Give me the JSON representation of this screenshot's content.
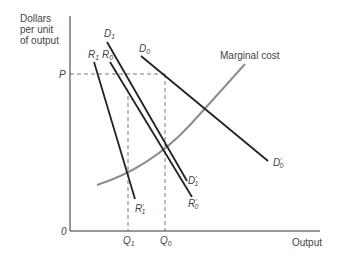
{
  "axes": {
    "y_label_lines": [
      "Dollars",
      "per unit",
      "of output"
    ],
    "x_label": "Output",
    "origin": "0",
    "price_label": "P",
    "q1_label": "Q",
    "q1_sub": "1",
    "q0_label": "Q",
    "q0_sub": "0"
  },
  "curves": {
    "mc_label": "Marginal cost",
    "d1": {
      "name": "D",
      "sub": "1",
      "end_name": "D",
      "end_sup": "′",
      "end_sub": "1"
    },
    "d0": {
      "name": "D",
      "sub": "0",
      "end_name": "D",
      "end_sup": "′",
      "end_sub": "0"
    },
    "r1": {
      "name": "R",
      "sub": "1",
      "end_name": "R",
      "end_sup": "′",
      "end_sub": "1"
    },
    "r0": {
      "name": "R",
      "sub": "0",
      "end_name": "R",
      "end_sup": "′",
      "end_sub": "0"
    }
  },
  "colors": {
    "line": "#222222",
    "mc": "#8c8c8c",
    "axis": "#333333",
    "dash": "#555555"
  }
}
